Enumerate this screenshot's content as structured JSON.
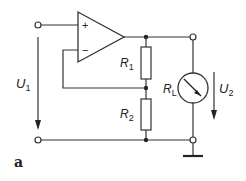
{
  "diagram": {
    "type": "circuit",
    "caption": "a",
    "components": {
      "opamp": {
        "plus": "+",
        "minus": "−"
      },
      "R1": {
        "label": "R",
        "sub": "1"
      },
      "R2": {
        "label": "R",
        "sub": "2"
      },
      "RL": {
        "label": "R",
        "sub": "L"
      }
    },
    "voltages": {
      "U1": {
        "label": "U",
        "sub": "1"
      },
      "U2": {
        "label": "U",
        "sub": "2"
      }
    },
    "colors": {
      "line": "#333333",
      "background": "#ffffff"
    }
  }
}
